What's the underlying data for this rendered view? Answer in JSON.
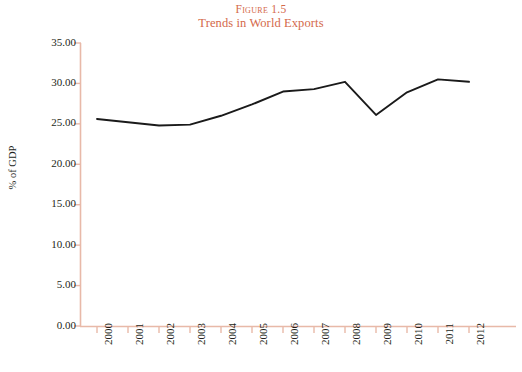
{
  "title": {
    "figure_number": "FIGURE 1.5",
    "subtitle": "Trends in World Exports",
    "color": "#d4694a"
  },
  "axes": {
    "ylabel": "% of GDP",
    "ytick_labels": [
      "35.00",
      "30.00",
      "25.00",
      "20.00",
      "15.00",
      "10.00",
      "5.00",
      "0.00"
    ],
    "xtick_labels": [
      "2000",
      "2001",
      "2002",
      "2003",
      "2004",
      "2005",
      "2006",
      "2007",
      "2008",
      "2009",
      "2010",
      "2011",
      "2012"
    ],
    "axis_color": "#e8b9a8",
    "tick_color": "#e8b9a8"
  },
  "series_style": {
    "line_color": "#1a1a1a",
    "line_width": "1.9"
  },
  "chart_data": {
    "type": "line",
    "title": "Trends in World Exports",
    "subtitle": "FIGURE 1.5",
    "xlabel": "",
    "ylabel": "% of GDP",
    "categories": [
      "2000",
      "2001",
      "2002",
      "2003",
      "2004",
      "2005",
      "2006",
      "2007",
      "2008",
      "2009",
      "2010",
      "2011",
      "2012"
    ],
    "values": [
      25.6,
      25.2,
      24.8,
      24.9,
      26.0,
      27.4,
      29.0,
      29.3,
      30.2,
      26.1,
      28.9,
      30.5,
      30.2
    ],
    "ylim": [
      0,
      35
    ],
    "ytick_step": 5,
    "grid": false,
    "legend": "none",
    "series": [
      {
        "name": "World exports",
        "values": [
          25.6,
          25.2,
          24.8,
          24.9,
          26.0,
          27.4,
          29.0,
          29.3,
          30.2,
          26.1,
          28.9,
          30.5,
          30.2
        ]
      }
    ]
  }
}
